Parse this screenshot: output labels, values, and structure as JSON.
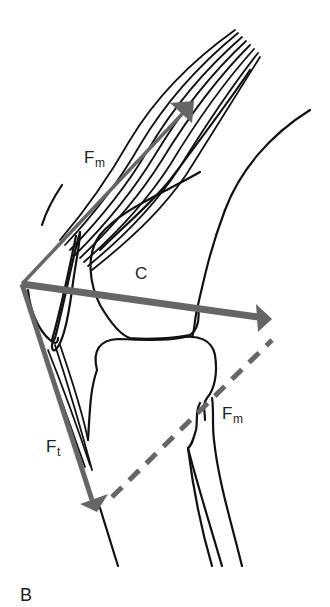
{
  "figure": {
    "panel_label": "B",
    "labels": {
      "muscle_force_upper": {
        "main": "F",
        "sub": "m"
      },
      "compression_force": {
        "main": "C"
      },
      "tendon_force": {
        "main": "F",
        "sub": "t"
      },
      "muscle_force_lower": {
        "main": "F",
        "sub": "m"
      }
    },
    "colors": {
      "outline": "#111111",
      "vector": "#666666",
      "text": "#222222",
      "background": "#ffffff"
    }
  }
}
